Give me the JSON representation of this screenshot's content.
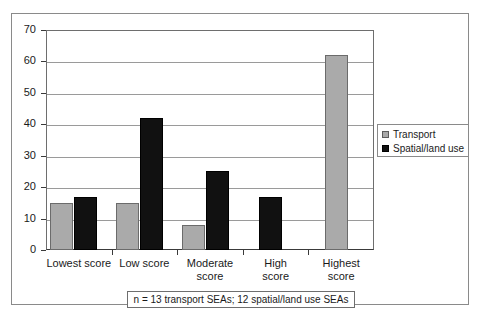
{
  "chart_data": {
    "type": "bar",
    "title": "",
    "xlabel": "",
    "ylabel": "",
    "ylim": [
      0,
      70
    ],
    "ytick_values": [
      0,
      10,
      20,
      30,
      40,
      50,
      60,
      70
    ],
    "ytick_labels": [
      "0",
      "10",
      "20",
      "30",
      "40",
      "50",
      "60",
      "70"
    ],
    "grid": true,
    "legend_position": "right",
    "categories": [
      "Lowest score",
      "Low score",
      "Moderate\nscore",
      "High\nscore",
      "Highest\nscore"
    ],
    "series": [
      {
        "name": "Transport",
        "color": "#aaaaaa",
        "values": [
          15,
          15,
          8,
          null,
          62
        ]
      },
      {
        "name": "Spatial/land use",
        "color": "#111111",
        "values": [
          17,
          42,
          25,
          17,
          null
        ]
      }
    ],
    "annotation": "n = 13 transport SEAs; 12 spatial/land use SEAs"
  },
  "legend": {
    "items": [
      {
        "label": "Transport",
        "swatch": "transport"
      },
      {
        "label": "Spatial/land use",
        "swatch": "spatial"
      }
    ]
  },
  "footnote": {
    "text": "n = 13 transport SEAs; 12 spatial/land use SEAs"
  }
}
